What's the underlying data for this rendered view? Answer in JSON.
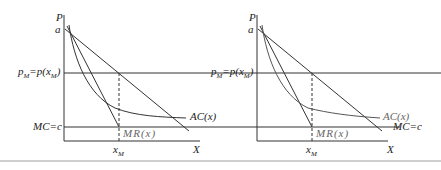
{
  "figure": {
    "colors": {
      "line": "#333333",
      "grey_text": "#666666",
      "rule": "#cfcfcf"
    }
  },
  "panels": [
    {
      "id": "left",
      "labels": {
        "y_axis": "P",
        "intercept": "a",
        "price_main": "p",
        "price_sub": "M",
        "price_eq": "=p(x",
        "price_eq_sub": "M",
        "price_close": ")",
        "mc": "MC=c",
        "ac": "AC(x)",
        "mr": "MR(x)",
        "xm_main": "x",
        "xm_sub": "M",
        "x_axis": "X"
      }
    },
    {
      "id": "right",
      "labels": {
        "y_axis": "P",
        "intercept": "a",
        "price_main": "p",
        "price_sub": "M",
        "price_eq": "=p(x",
        "price_eq_sub": "M",
        "price_close": ")",
        "mc": "MC=c",
        "ac": "AC(x)",
        "mr": "MR(x)",
        "xm_main": "x",
        "xm_sub": "M",
        "x_axis": "X"
      }
    }
  ]
}
